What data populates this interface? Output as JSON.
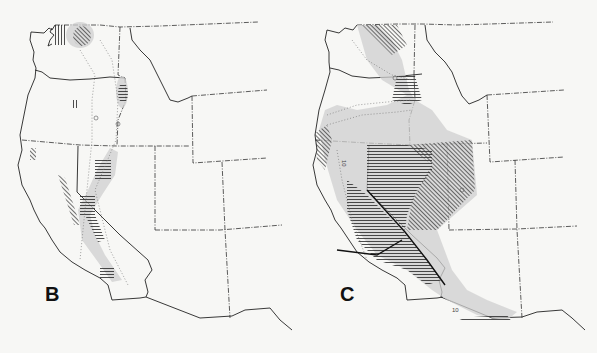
{
  "figure": {
    "panels": [
      {
        "label": "B",
        "region": "Western United States",
        "features": [
          "stippled distribution zones",
          "vertical hatching",
          "diagonal hatching",
          "horizontal hatching",
          "dotted migration routes with arrow marks"
        ]
      },
      {
        "label": "C",
        "region": "Western United States",
        "features": [
          "stippled distribution zones",
          "diagonal hatching",
          "horizontal hatching",
          "bold boundary lines",
          "dotted migration routes with arrow marks"
        ],
        "annotations": [
          "10",
          "10"
        ]
      }
    ]
  },
  "colors": {
    "background": "#f7f7f5",
    "lines": "#222222",
    "stipple": "#cfcfcf"
  }
}
